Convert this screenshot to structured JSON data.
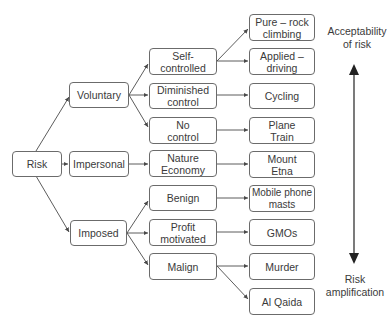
{
  "diagram": {
    "root": "Risk",
    "level1": [
      "Voluntary",
      "Impersonal",
      "Imposed"
    ],
    "level2": [
      "Self-\ncontrolled",
      "Diminished\ncontrol",
      "No\ncontrol",
      "Nature\nEconomy",
      "Benign",
      "Profit\nmotivated",
      "Malign"
    ],
    "level3": [
      "Pure – rock\nclimbing",
      "Applied –\ndriving",
      "Cycling",
      "Plane\nTrain",
      "Mount\nEtna",
      "Mobile phone\nmasts",
      "GMOs",
      "Murder",
      "Al Qaida"
    ],
    "scale": {
      "top_label": "Acceptability\nof risk",
      "bottom_label": "Risk\namplification"
    },
    "edges": [
      [
        "Risk",
        "Voluntary"
      ],
      [
        "Risk",
        "Impersonal"
      ],
      [
        "Risk",
        "Imposed"
      ],
      [
        "Voluntary",
        "Self-controlled"
      ],
      [
        "Voluntary",
        "Diminished control"
      ],
      [
        "Voluntary",
        "No control"
      ],
      [
        "Impersonal",
        "Nature Economy"
      ],
      [
        "Imposed",
        "Benign"
      ],
      [
        "Imposed",
        "Profit motivated"
      ],
      [
        "Imposed",
        "Malign"
      ],
      [
        "Self-controlled",
        "Pure – rock climbing"
      ],
      [
        "Self-controlled",
        "Applied – driving"
      ],
      [
        "Diminished control",
        "Cycling"
      ],
      [
        "No control",
        "Plane Train"
      ],
      [
        "Nature Economy",
        "Mount Etna"
      ],
      [
        "Benign",
        "Mobile phone masts"
      ],
      [
        "Profit motivated",
        "GMOs"
      ],
      [
        "Malign",
        "Murder"
      ],
      [
        "Malign",
        "Al Qaida"
      ]
    ],
    "colors": {
      "line": "#4a4a4a",
      "text": "#3a3a3a",
      "border": "#6b6b6b"
    }
  }
}
